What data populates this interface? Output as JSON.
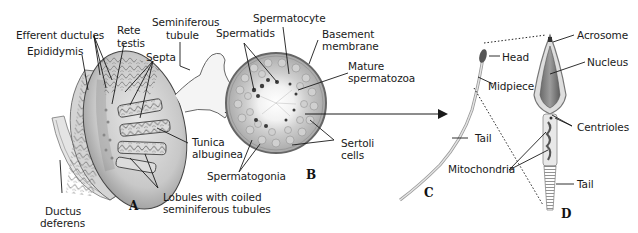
{
  "figure": {
    "panels": [
      {
        "id": "A",
        "description": "Testis sagittal section with epididymis"
      },
      {
        "id": "B",
        "description": "Seminiferous tubule cross-section"
      },
      {
        "id": "C",
        "description": "Whole spermatozoon"
      },
      {
        "id": "D",
        "description": "Spermatozoon enlarged detail"
      }
    ],
    "labels": {
      "efferent_ductules": "Efferent ductules",
      "rete_testis_1": "Rete",
      "rete_testis_2": "testis",
      "seminiferous_tubule_1": "Seminiferous",
      "seminiferous_tubule_2": "tubule",
      "epididymis": "Epididymis",
      "septa": "Septa",
      "tunica_1": "Tunica",
      "tunica_2": "albuginea",
      "ductus_1": "Ductus",
      "ductus_2": "deferens",
      "lobules_1": "Lobules with coiled",
      "lobules_2": "seminiferous tubules",
      "spermatocyte": "Spermatocyte",
      "spermatids": "Spermatids",
      "basement_1": "Basement",
      "basement_2": "membrane",
      "mature_1": "Mature",
      "mature_2": "spermatozoa",
      "sertoli_1": "Sertoli",
      "sertoli_2": "cells",
      "spermatogonia": "Spermatogonia",
      "head": "Head",
      "midpiece": "Midpiece",
      "tail_c": "Tail",
      "mitochondria": "Mitochondria",
      "acrosome": "Acrosome",
      "nucleus": "Nucleus",
      "centrioles": "Centrioles",
      "tail_d": "Tail"
    },
    "panel_letters": {
      "a": "A",
      "b": "B",
      "c": "C",
      "d": "D"
    },
    "colors": {
      "tissue_light": "#e2e2e2",
      "tissue_mid": "#b8b8b8",
      "tissue_dark": "#6e6e6e",
      "nucleus": "#8a8a8a",
      "line": "#1a1a1a"
    }
  }
}
